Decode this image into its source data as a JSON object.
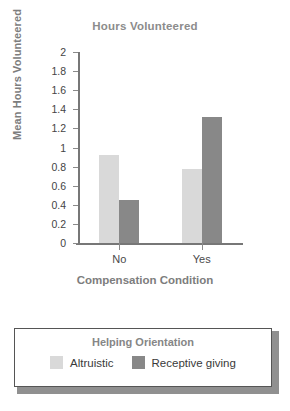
{
  "chart_data": {
    "type": "bar",
    "title": "Hours Volunteered",
    "xlabel": "Compensation Condition",
    "ylabel": "Mean Hours Volunteered",
    "categories": [
      "No",
      "Yes"
    ],
    "series": [
      {
        "name": "Altruistic",
        "values": [
          0.92,
          0.78
        ],
        "color": "#d9d9d9"
      },
      {
        "name": "Receptive giving",
        "values": [
          0.45,
          1.32
        ],
        "color": "#888888"
      }
    ],
    "ylim": [
      0,
      2
    ],
    "ytick_step": 0.2,
    "yticks": [
      "0",
      "0.2",
      "0.4",
      "0.6",
      "0.8",
      "1",
      "1.2",
      "1.4",
      "1.6",
      "1.8",
      "2"
    ],
    "grid": false,
    "legend_position": "bottom",
    "legend_title": "Helping Orientation"
  },
  "colors": {
    "axis": "#777777",
    "title_text": "#8c8c8c",
    "axis_title_text": "#7d7d7d",
    "tick_text": "#444444",
    "legend_border": "#555555",
    "legend_title_text": "#868686",
    "legend_label_text": "#3a3a3a",
    "legend_shadow": "#909090",
    "series_1": "#d9d9d9",
    "series_2": "#888888",
    "background": "#ffffff"
  }
}
